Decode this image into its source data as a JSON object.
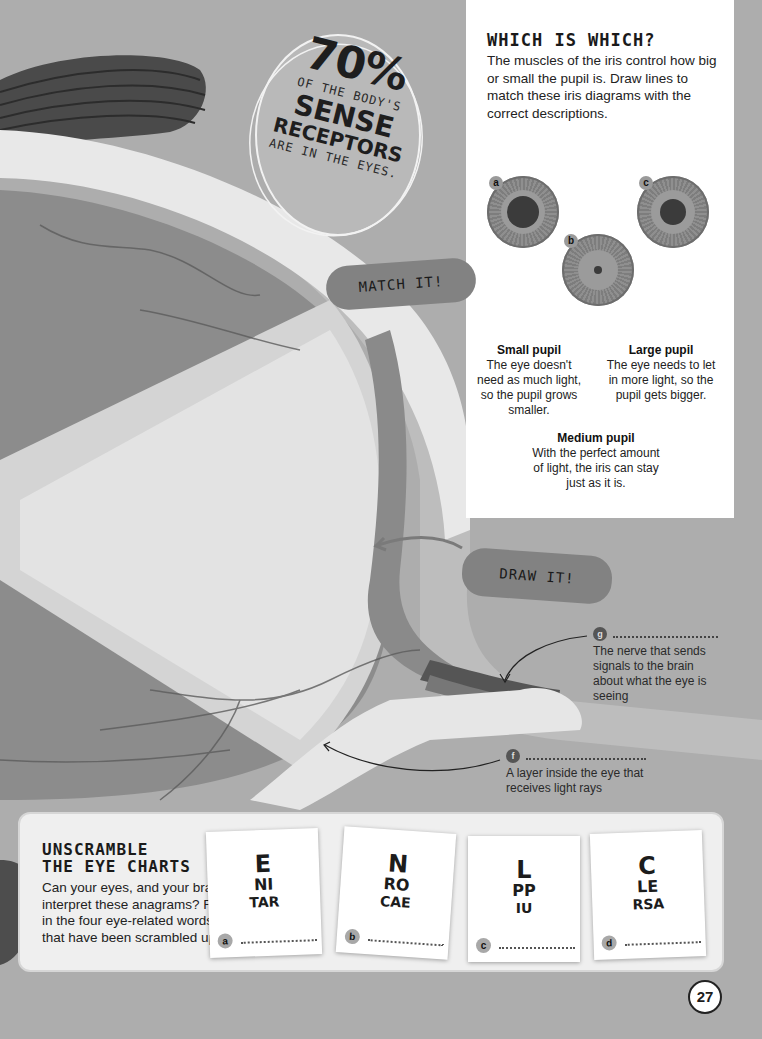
{
  "stat": {
    "percent": "70%",
    "line1": "OF THE BODY'S",
    "line2": "SENSE",
    "line3": "RECEPTORS",
    "line4": "ARE IN THE EYES."
  },
  "which_is_which": {
    "title": "WHICH IS WHICH?",
    "intro": "The muscles of the iris control how big or small the pupil is. Draw lines to match these iris diagrams with the correct descriptions.",
    "diagrams": [
      {
        "badge": "a",
        "pupil_size": "large"
      },
      {
        "badge": "b",
        "pupil_size": "small"
      },
      {
        "badge": "c",
        "pupil_size": "medium"
      }
    ],
    "descriptions": [
      {
        "title": "Small pupil",
        "text": "The eye doesn't need as much light, so the pupil grows smaller."
      },
      {
        "title": "Large pupil",
        "text": "The eye needs to let in more light, so the pupil gets bigger."
      },
      {
        "title": "Medium pupil",
        "text": "With the perfect amount of light, the iris can stay just as it is."
      }
    ]
  },
  "clouds": {
    "match": "MATCH IT!",
    "draw": "DRAW IT!"
  },
  "labels": [
    {
      "badge": "g",
      "text": "The nerve that sends signals to the brain about what the eye is seeing"
    },
    {
      "badge": "f",
      "text": "A layer inside the eye that receives light rays"
    }
  ],
  "unscramble": {
    "title_line1": "UNSCRAMBLE",
    "title_line2": "THE EYE CHARTS",
    "text": "Can your eyes, and your brain, interpret these anagrams? Fill in the four eye-related words that have been scrambled up.",
    "cards": [
      {
        "badge": "a",
        "line1": "E",
        "line2": "NI",
        "line3": "TAR"
      },
      {
        "badge": "b",
        "line1": "N",
        "line2": "RO",
        "line3": "CAE"
      },
      {
        "badge": "c",
        "line1": "L",
        "line2": "PP",
        "line3": "IU"
      },
      {
        "badge": "d",
        "line1": "C",
        "line2": "LE",
        "line3": "RSA"
      }
    ]
  },
  "page_number": "27"
}
